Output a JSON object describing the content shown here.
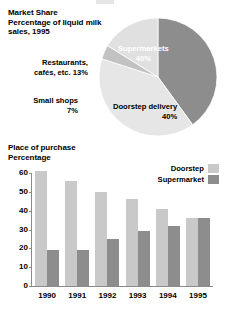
{
  "pie_section": {
    "title_lines": [
      "Market Share",
      "Percentage of liquid milk",
      "sales, 1995"
    ],
    "labels": {
      "supermarkets_name": "Supermarkets",
      "supermarkets_value": "40%",
      "doorstep_name": "Doorstep delivery",
      "doorstep_value": "40%",
      "restaurants_line1": "Restaurants,",
      "restaurants_line2": "cafés, etc. 13%",
      "small_shops_line1": "Small shops",
      "small_shops_line2": "7%"
    }
  },
  "bar_section": {
    "title_lines": [
      "Place of purchase",
      "Percentage"
    ],
    "legend": [
      {
        "label": "Doorstep",
        "color": "#c9c9c9"
      },
      {
        "label": "Supermarket",
        "color": "#8d8d8d"
      }
    ]
  },
  "colors": {
    "supermarket_dark": "#8d8d8d",
    "doorstep_light": "#e6e6e6",
    "restaurants_light": "#e0e0e0",
    "small_shops_mid": "#c2c2c2",
    "bar_doorstep": "#c9c9c9",
    "bar_supermarket": "#8d8d8d",
    "axis": "#8a8a8a",
    "text": "#000000"
  },
  "chart_data": [
    {
      "type": "pie",
      "title": "Market Share — Percentage of liquid milk sales, 1995",
      "labels": [
        "Supermarkets",
        "Doorstep delivery",
        "Small shops",
        "Restaurants, cafés, etc."
      ],
      "values": [
        40,
        40,
        7,
        13
      ],
      "value_labels": [
        "40%",
        "40%",
        "7%",
        "13%"
      ],
      "colors": [
        "#8d8d8d",
        "#e6e6e6",
        "#c2c2c2",
        "#e0e0e0"
      ],
      "legend": "labels placed around and inside slices",
      "start_angle_deg": -90,
      "direction": "clockwise"
    },
    {
      "type": "bar",
      "title": "Place of purchase",
      "ylabel": "Percentage",
      "xlabel": "",
      "categories": [
        "1990",
        "1991",
        "1992",
        "1993",
        "1994",
        "1995"
      ],
      "series": [
        {
          "name": "Doorstep",
          "color": "#c9c9c9",
          "values": [
            61,
            56,
            50,
            46,
            41,
            36
          ]
        },
        {
          "name": "Supermarket",
          "color": "#8d8d8d",
          "values": [
            19,
            19,
            25,
            29,
            32,
            36
          ]
        }
      ],
      "ylim": [
        0,
        60
      ],
      "yticks": [
        0,
        10,
        20,
        30,
        40,
        50,
        60
      ],
      "grid": false,
      "legend_position": "top-right"
    }
  ]
}
